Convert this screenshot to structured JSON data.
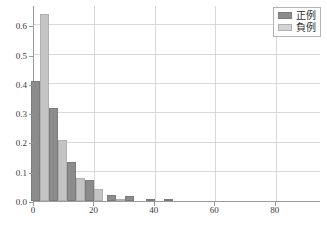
{
  "chart_data": {
    "type": "bar",
    "title": "",
    "xlabel": "",
    "ylabel": "",
    "xlim": [
      0,
      95
    ],
    "ylim": [
      0.0,
      0.67
    ],
    "grid": true,
    "legend_position": "top-right",
    "bin_width": 6,
    "x": [
      2,
      8,
      14,
      20,
      27,
      33,
      40,
      46
    ],
    "categories": [
      "2",
      "8",
      "14",
      "20",
      "27",
      "33",
      "40",
      "46"
    ],
    "series": [
      {
        "name": "正例",
        "color": "#8c8c8c",
        "values": [
          0.41,
          0.317,
          0.134,
          0.072,
          0.02,
          0.016,
          0.004,
          0.003
        ]
      },
      {
        "name": "負例",
        "color": "#c4c4c4",
        "values": [
          0.64,
          0.21,
          0.079,
          0.041,
          0.008,
          0.0,
          0.0,
          0.0
        ]
      }
    ],
    "yticks": [
      0.0,
      0.1,
      0.2,
      0.3,
      0.4,
      0.5,
      0.6
    ],
    "ytick_labels": [
      "0.0",
      "0.1",
      "0.2",
      "0.3",
      "0.4",
      "0.5",
      "0.6"
    ],
    "xticks": [
      0,
      20,
      40,
      60,
      80
    ],
    "xtick_labels": [
      "0",
      "20",
      "40",
      "60",
      "80"
    ]
  },
  "legend": {
    "items": [
      {
        "label": "正例",
        "swatch": "pos"
      },
      {
        "label": "負例",
        "swatch": "neg"
      }
    ]
  },
  "colors": {
    "positive_bar": "#8c8c8c",
    "negative_bar": "#c4c4c4",
    "gridline": "#d9d9d9",
    "axis": "#9a9a9a",
    "background": "#ffffff",
    "text": "#3a3a3a"
  }
}
